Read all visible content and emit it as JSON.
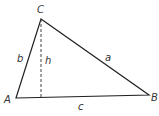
{
  "diagram": {
    "type": "triangle-with-altitude",
    "vertices": {
      "A": {
        "label": "A",
        "x": 16,
        "y": 98
      },
      "B": {
        "label": "B",
        "x": 149,
        "y": 95
      },
      "C": {
        "label": "C",
        "x": 41,
        "y": 19
      }
    },
    "sides": {
      "a": {
        "label": "a",
        "from": "C",
        "to": "B"
      },
      "b": {
        "label": "b",
        "from": "A",
        "to": "C"
      },
      "c": {
        "label": "c",
        "from": "A",
        "to": "B"
      }
    },
    "altitude": {
      "label": "h",
      "from": "C",
      "style": "dashed"
    },
    "colors": {
      "stroke": "#222222",
      "text": "#333333",
      "background": "#ffffff"
    }
  }
}
